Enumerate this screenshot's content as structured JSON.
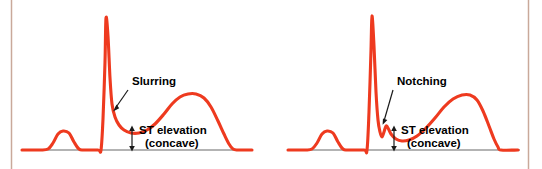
{
  "figure": {
    "width": 542,
    "height": 169,
    "background_color": "#ffffff",
    "trace_color": "#ee3a1f",
    "baseline_color": "#9a9a9a",
    "annotation_color": "#000000",
    "side_rule_color": "#c9a99a"
  },
  "panels": [
    {
      "id": "left-panel",
      "annotations": {
        "morphology_label": "Slurring",
        "st_label_line1": "ST elevation",
        "st_label_line2": "(concave)"
      }
    },
    {
      "id": "right-panel",
      "annotations": {
        "morphology_label": "Notching",
        "st_label_line1": "ST elevation",
        "st_label_line2": "(concave)"
      }
    }
  ],
  "chart_data": {
    "type": "line",
    "title": "",
    "xlabel": "",
    "ylabel": "",
    "grid": false,
    "legend": null,
    "xlim": [
      0,
      542
    ],
    "ylim": [
      0,
      169
    ],
    "note": "ECG waveform tracings; y pixel values are screen coords (smaller y = higher voltage). Baseline (isoelectric line) at y = 150.",
    "baseline_y": 150,
    "series": [
      {
        "name": "left-tracing-slurring",
        "points": [
          [
            22,
            150
          ],
          [
            40,
            150
          ],
          [
            48,
            149
          ],
          [
            53,
            143
          ],
          [
            58,
            134
          ],
          [
            63,
            131
          ],
          [
            69,
            133
          ],
          [
            74,
            142
          ],
          [
            79,
            149
          ],
          [
            84,
            150
          ],
          [
            98,
            150
          ],
          [
            101,
            150
          ],
          [
            103,
            119
          ],
          [
            105,
            62
          ],
          [
            106,
            18
          ],
          [
            108,
            36
          ],
          [
            110,
            78
          ],
          [
            112,
            104
          ],
          [
            115,
            117
          ],
          [
            119,
            125
          ],
          [
            124,
            130
          ],
          [
            131,
            133
          ],
          [
            139,
            133
          ],
          [
            147,
            130
          ],
          [
            155,
            124
          ],
          [
            164,
            114
          ],
          [
            172,
            104
          ],
          [
            180,
            97
          ],
          [
            188,
            94
          ],
          [
            196,
            94
          ],
          [
            204,
            98
          ],
          [
            211,
            107
          ],
          [
            218,
            121
          ],
          [
            224,
            134
          ],
          [
            229,
            144
          ],
          [
            233,
            149
          ],
          [
            238,
            150
          ],
          [
            252,
            150
          ]
        ]
      },
      {
        "name": "right-tracing-notching",
        "points": [
          [
            288,
            150
          ],
          [
            305,
            150
          ],
          [
            312,
            149
          ],
          [
            317,
            143
          ],
          [
            322,
            134
          ],
          [
            327,
            131
          ],
          [
            333,
            133
          ],
          [
            338,
            142
          ],
          [
            343,
            149
          ],
          [
            348,
            150
          ],
          [
            364,
            150
          ],
          [
            367,
            150
          ],
          [
            369,
            112
          ],
          [
            371,
            50
          ],
          [
            372,
            16
          ],
          [
            374,
            46
          ],
          [
            376,
            92
          ],
          [
            378,
            120
          ],
          [
            380,
            132
          ],
          [
            382,
            137
          ],
          [
            384,
            132
          ],
          [
            386,
            126
          ],
          [
            388,
            128
          ],
          [
            391,
            134
          ],
          [
            396,
            139
          ],
          [
            402,
            141
          ],
          [
            409,
            140
          ],
          [
            417,
            136
          ],
          [
            426,
            128
          ],
          [
            435,
            118
          ],
          [
            444,
            107
          ],
          [
            453,
            99
          ],
          [
            462,
            95
          ],
          [
            470,
            95
          ],
          [
            477,
            100
          ],
          [
            483,
            111
          ],
          [
            489,
            126
          ],
          [
            494,
            139
          ],
          [
            498,
            147
          ],
          [
            501,
            150
          ],
          [
            518,
            150
          ]
        ]
      }
    ],
    "annotation_markers": [
      {
        "label": "Slurring",
        "text_x": 132,
        "text_y": 82,
        "leader_from": [
          128,
          90
        ],
        "leader_to": [
          113,
          111
        ]
      },
      {
        "label": "ST elevation",
        "text_x": 142,
        "text_y": 131,
        "arrow_top": [
          132,
          128
        ],
        "arrow_bottom": [
          132,
          149
        ]
      },
      {
        "label": "(concave)",
        "text_x": 146,
        "text_y": 143
      },
      {
        "label": "Notching",
        "text_x": 397,
        "text_y": 82,
        "leader_from": [
          393,
          90
        ],
        "leader_to": [
          382,
          124
        ]
      },
      {
        "label": "ST elevation",
        "text_x": 404,
        "text_y": 131,
        "arrow_top": [
          394,
          128
        ],
        "arrow_bottom": [
          394,
          149
        ]
      },
      {
        "label": "(concave)",
        "text_x": 408,
        "text_y": 143
      }
    ]
  }
}
